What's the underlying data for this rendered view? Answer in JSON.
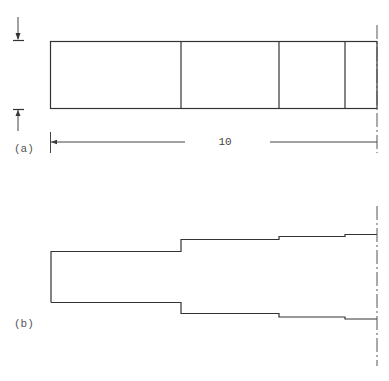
{
  "figure": {
    "part_a": {
      "label": "(a)",
      "description": "Bar divided into 4 segments with dimension line",
      "bar": {
        "x_start": 50,
        "x_end": 377,
        "y_top": 41,
        "y_bottom": 108
      },
      "dividers_x": [
        181,
        279,
        345
      ],
      "dimension": {
        "value": "10",
        "y": 142,
        "x_start": 50,
        "x_end": 377
      },
      "arrows": [
        "top-down-arrow",
        "bottom-up-arrow"
      ]
    },
    "part_b": {
      "label": "(b)",
      "description": "Stepped profile symmetric about centerline",
      "segments": [
        {
          "x_start": 51,
          "x_end": 181,
          "y_top": 251,
          "y_bottom": 302
        },
        {
          "x_start": 181,
          "x_end": 279,
          "y_top": 239,
          "y_bottom": 313
        },
        {
          "x_start": 279,
          "x_end": 345,
          "y_top": 236,
          "y_bottom": 317
        },
        {
          "x_start": 345,
          "x_end": 377,
          "y_top": 234,
          "y_bottom": 319
        }
      ]
    },
    "colors": {
      "line": "#333333",
      "background": "#ffffff",
      "label": "#555555"
    }
  }
}
